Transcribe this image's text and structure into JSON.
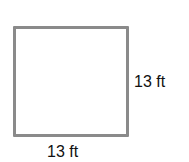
{
  "figure": {
    "shape": "square",
    "stroke_color": "#8a8a8a",
    "side_label": "13 ft",
    "bottom_label": "13 ft"
  }
}
